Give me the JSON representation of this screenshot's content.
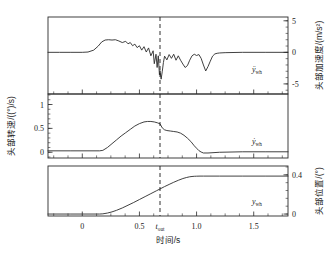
{
  "figure": {
    "background": "#ffffff",
    "line_color": "#2b2b2b",
    "dash_color": "#1a1a1a"
  },
  "xaxis": {
    "label": "时间/s",
    "tick_labels": [
      "0",
      "0.5",
      "1.0",
      "1.5"
    ],
    "tick_values": [
      0,
      0.5,
      1.0,
      1.5
    ],
    "range": [
      -0.3,
      1.8
    ],
    "marker_label": "t",
    "marker_sub": "out",
    "marker_value": 0.68
  },
  "panels": {
    "top": {
      "name": "head-acceleration",
      "axis_label": "头部加速度/(m/s²)",
      "axis_side": "right",
      "tick_labels": [
        "5",
        "0",
        "-5"
      ],
      "tick_values": [
        5,
        0,
        -5
      ],
      "range": [
        -6.6,
        5.6
      ],
      "curve_label": "ÿ",
      "curve_label_sub": "wh"
    },
    "middle": {
      "name": "head-angular-velocity",
      "axis_label": "头部转速/((°)/s)",
      "axis_side": "left",
      "tick_labels": [
        "1",
        "0.5",
        "0"
      ],
      "tick_values": [
        1,
        0.5,
        0
      ],
      "range": [
        -0.12,
        1.22
      ],
      "curve_label": "ẏ",
      "curve_label_sub": "wh"
    },
    "bottom": {
      "name": "head-position",
      "axis_label": "头部位置/(°)",
      "axis_side": "right",
      "tick_labels": [
        "0.4",
        "0"
      ],
      "tick_values": [
        0.4,
        0
      ],
      "range": [
        -0.02,
        0.49
      ],
      "curve_label": "y",
      "curve_label_sub": "wh"
    }
  },
  "chart_data": {
    "type": "line",
    "title": "",
    "xlabel": "时间/s",
    "xlim": [
      -0.3,
      1.8
    ],
    "xticks": [
      0,
      0.5,
      1.0,
      1.5
    ],
    "grid": false,
    "legend": "inline-annotations",
    "annotations": [
      {
        "text": "t_out",
        "x": 0.68,
        "type": "vertical-dashed-line"
      }
    ],
    "subplots": [
      {
        "name": "head acceleration",
        "ylabel": "头部加速度/(m/s²)",
        "ylabel_side": "right",
        "ylim": [
          -6.6,
          5.6
        ],
        "yticks": [
          -5,
          0,
          5
        ],
        "series_label": "ÿ_wh",
        "x": [
          -0.3,
          -0.2,
          -0.1,
          0.0,
          0.05,
          0.1,
          0.14,
          0.17,
          0.2,
          0.23,
          0.26,
          0.29,
          0.32,
          0.35,
          0.38,
          0.4,
          0.42,
          0.44,
          0.46,
          0.48,
          0.5,
          0.52,
          0.54,
          0.56,
          0.58,
          0.6,
          0.62,
          0.63,
          0.645,
          0.655,
          0.665,
          0.675,
          0.68,
          0.69,
          0.7,
          0.71,
          0.72,
          0.74,
          0.76,
          0.78,
          0.8,
          0.82,
          0.84,
          0.86,
          0.88,
          0.9,
          0.92,
          0.94,
          0.96,
          0.98,
          1.0,
          1.02,
          1.04,
          1.06,
          1.08,
          1.1,
          1.12,
          1.14,
          1.16,
          1.18,
          1.2,
          1.25,
          1.4,
          1.6,
          1.8
        ],
        "y": [
          0.0,
          0.0,
          0.0,
          0.0,
          0.05,
          0.35,
          1.0,
          1.65,
          1.95,
          2.0,
          1.95,
          2.0,
          1.8,
          1.55,
          1.75,
          1.35,
          1.55,
          1.05,
          1.3,
          0.75,
          1.05,
          0.35,
          0.9,
          0.05,
          0.7,
          -0.55,
          0.25,
          -1.8,
          -0.3,
          -2.4,
          -0.55,
          -3.55,
          -2.9,
          -4.25,
          -3.0,
          -1.6,
          -0.6,
          -1.2,
          -0.35,
          -0.95,
          -0.3,
          -1.25,
          -0.55,
          -1.25,
          -1.85,
          -2.4,
          -2.1,
          -1.25,
          -0.55,
          -0.3,
          -0.5,
          -0.35,
          -0.95,
          -2.0,
          -2.95,
          -2.25,
          -1.4,
          -0.6,
          -0.25,
          -0.15,
          -0.1,
          -0.05,
          0.0,
          0.0,
          0.0
        ]
      },
      {
        "name": "head angular velocity",
        "ylabel": "头部转速/((°)/s)",
        "ylabel_side": "left",
        "ylim": [
          -0.12,
          1.22
        ],
        "yticks": [
          0,
          0.5,
          1
        ],
        "series_label": "ẏ_wh",
        "x": [
          -0.3,
          -0.1,
          0.05,
          0.15,
          0.18,
          0.22,
          0.26,
          0.3,
          0.34,
          0.38,
          0.42,
          0.46,
          0.5,
          0.54,
          0.57,
          0.6,
          0.63,
          0.66,
          0.68,
          0.7,
          0.72,
          0.74,
          0.77,
          0.8,
          0.83,
          0.86,
          0.89,
          0.92,
          0.95,
          0.98,
          1.0,
          1.02,
          1.04,
          1.06,
          1.1,
          1.2,
          1.4,
          1.6,
          1.8
        ],
        "y": [
          0.03,
          0.03,
          0.03,
          0.03,
          0.04,
          0.1,
          0.18,
          0.26,
          0.34,
          0.41,
          0.48,
          0.55,
          0.6,
          0.635,
          0.645,
          0.645,
          0.635,
          0.615,
          0.595,
          0.51,
          0.47,
          0.455,
          0.445,
          0.435,
          0.425,
          0.4,
          0.355,
          0.295,
          0.225,
          0.135,
          0.085,
          0.035,
          0.005,
          -0.015,
          -0.015,
          0.0,
          0.01,
          0.01,
          0.01
        ]
      },
      {
        "name": "head position",
        "ylabel": "头部位置/(°)",
        "ylabel_side": "right",
        "ylim": [
          -0.02,
          0.49
        ],
        "yticks": [
          0,
          0.4
        ],
        "series_label": "y_wh",
        "x": [
          -0.3,
          -0.1,
          0.05,
          0.15,
          0.18,
          0.22,
          0.26,
          0.3,
          0.35,
          0.4,
          0.45,
          0.5,
          0.55,
          0.6,
          0.65,
          0.68,
          0.72,
          0.76,
          0.8,
          0.84,
          0.88,
          0.91,
          0.94,
          0.96,
          0.98,
          1.0,
          1.03,
          1.06,
          1.1,
          1.2,
          1.4,
          1.6,
          1.8
        ],
        "y": [
          0.0,
          0.0,
          0.0,
          0.0,
          0.002,
          0.01,
          0.022,
          0.038,
          0.062,
          0.09,
          0.118,
          0.148,
          0.178,
          0.208,
          0.238,
          0.256,
          0.28,
          0.302,
          0.324,
          0.344,
          0.362,
          0.372,
          0.38,
          0.383,
          0.385,
          0.386,
          0.387,
          0.387,
          0.387,
          0.387,
          0.387,
          0.387,
          0.387
        ]
      }
    ]
  }
}
